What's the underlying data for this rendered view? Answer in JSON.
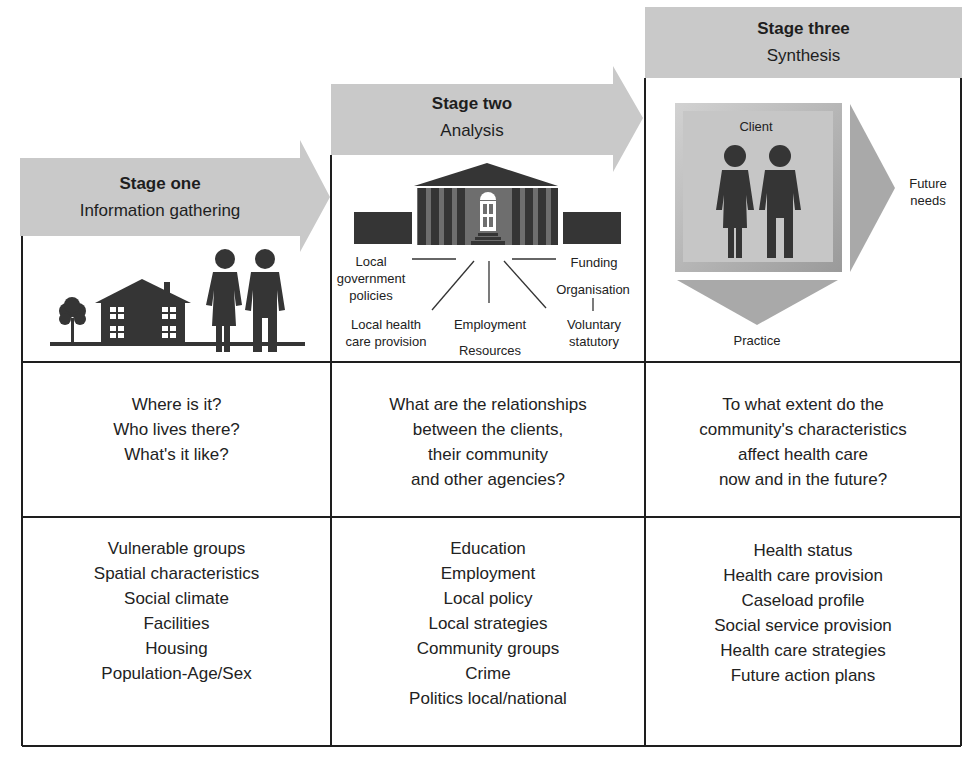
{
  "stages": [
    {
      "title": "Stage one",
      "subtitle": "Information gathering",
      "questions": [
        "Where is it?",
        "Who lives there?",
        "What's it like?"
      ],
      "items": [
        "Vulnerable groups",
        "Spatial characteristics",
        "Social climate",
        "Facilities",
        "Housing",
        "Population-Age/Sex"
      ]
    },
    {
      "title": "Stage two",
      "subtitle": "Analysis",
      "labels": {
        "local_gov": [
          "Local",
          "government",
          "policies"
        ],
        "local_health": [
          "Local health",
          "care provision"
        ],
        "employment": "Employment",
        "resources": "Resources",
        "funding": "Funding",
        "organisation": "Organisation",
        "voluntary": [
          "Voluntary",
          "statutory"
        ]
      },
      "questions": [
        "What are the relationships",
        "between the clients,",
        "their community",
        "and other agencies?"
      ],
      "items": [
        "Education",
        "Employment",
        "Local policy",
        "Local strategies",
        "Community groups",
        "Crime",
        "Politics local/national"
      ]
    },
    {
      "title": "Stage three",
      "subtitle": "Synthesis",
      "labels": {
        "client": "Client",
        "future_needs": [
          "Future",
          "needs"
        ],
        "practice": "Practice"
      },
      "questions": [
        "To what extent do the",
        "community's characteristics",
        "affect health care",
        "now and in the future?"
      ],
      "items": [
        "Health status",
        "Health care provision",
        "Caseload profile",
        "Social service provision",
        "Health care strategies",
        "Future action plans"
      ]
    }
  ],
  "colors": {
    "arrow_fill": "#c8c8c8",
    "figure_fill": "#353535",
    "building_wall": "#6e6e6e",
    "border": "#1e1e1e"
  }
}
